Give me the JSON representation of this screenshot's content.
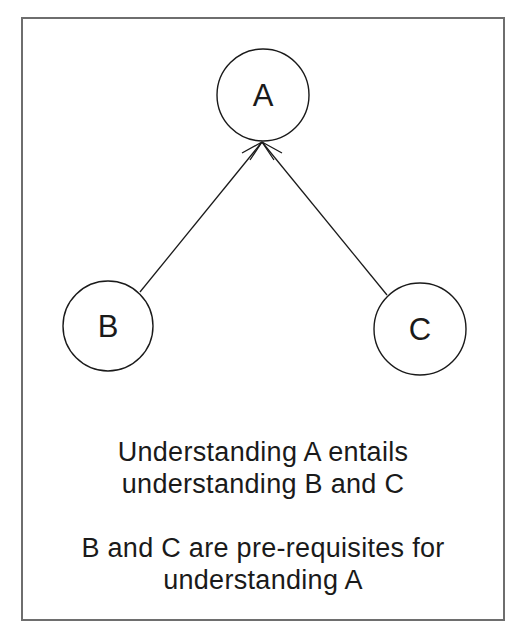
{
  "diagram": {
    "type": "prerequisite-tree",
    "nodes": [
      {
        "id": "A",
        "label": "A",
        "cx": 263,
        "cy": 95,
        "r": 46
      },
      {
        "id": "B",
        "label": "B",
        "cx": 108,
        "cy": 326,
        "r": 45
      },
      {
        "id": "C",
        "label": "C",
        "cx": 420,
        "cy": 329,
        "r": 46
      }
    ],
    "edges": [
      {
        "from": "B",
        "to": "A",
        "arrow": "open-arrowhead-at-A"
      },
      {
        "from": "C",
        "to": "A",
        "arrow": "open-arrowhead-at-A"
      }
    ],
    "colors": {
      "stroke": "#1a1a1a",
      "frame": "#6e6e6e",
      "background": "#ffffff"
    }
  },
  "captions": {
    "first": {
      "line1": "Understanding A entails",
      "line2": "understanding B and C"
    },
    "second": {
      "line1": "B and C are pre-requisites for",
      "line2": "understanding A"
    }
  }
}
